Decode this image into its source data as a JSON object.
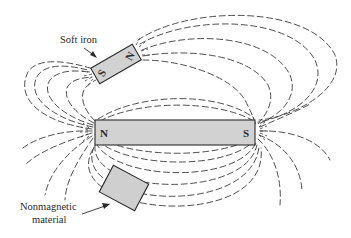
{
  "figure": {
    "bar_magnet": {
      "north_label": "N",
      "south_label": "S"
    },
    "soft_iron": {
      "label": "Soft iron",
      "north_label": "N",
      "south_label": "S"
    },
    "nonmagnetic": {
      "label_line1": "Nonmagnetic",
      "label_line2": "material"
    },
    "colors": {
      "magnet_fill": "#d2d2d2",
      "line": "#3a3a3a",
      "background": "#ffffff"
    }
  }
}
